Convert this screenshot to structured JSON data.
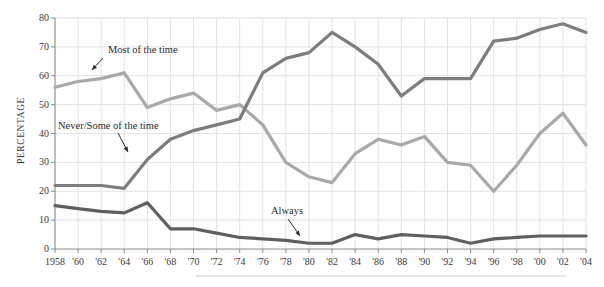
{
  "chart_data": {
    "type": "line",
    "title": "",
    "subtitle": "",
    "xlabel": "",
    "ylabel": "PERCENTAGE",
    "xlim": [
      1958,
      2004
    ],
    "ylim": [
      0,
      80
    ],
    "grid": true,
    "legend_position": "inline-annotations",
    "x": [
      1958,
      1960,
      1962,
      1964,
      1966,
      1968,
      1970,
      1972,
      1974,
      1976,
      1978,
      1980,
      1982,
      1984,
      1986,
      1988,
      1990,
      1992,
      1994,
      1996,
      1998,
      2000,
      2002,
      2004
    ],
    "xtick_labels": [
      "1958",
      "'60",
      "'62",
      "'64",
      "'66",
      "'68",
      "'70",
      "'72",
      "'74",
      "'76",
      "'78",
      "'80",
      "'82",
      "'84",
      "'86",
      "'88",
      "'90",
      "'92",
      "'94",
      "'96",
      "'98",
      "'00",
      "'02",
      "'04"
    ],
    "ytick_labels": [
      "0",
      "10",
      "20",
      "30",
      "40",
      "50",
      "60",
      "70",
      "80"
    ],
    "yticks": [
      0,
      10,
      20,
      30,
      40,
      50,
      60,
      70,
      80
    ],
    "series": [
      {
        "name": "Most of the time",
        "color": "#a9a9a9",
        "values": [
          56,
          58,
          59,
          61,
          49,
          54,
          52,
          48,
          50,
          38,
          33,
          30,
          24,
          23,
          31,
          37,
          35,
          40,
          40,
          36,
          30,
          21,
          26,
          36
        ]
      },
      {
        "name": "Never/Some of the time",
        "color": "#7d7d7d",
        "values": [
          22,
          22,
          22,
          21,
          31,
          37,
          41,
          45,
          50,
          61,
          62,
          63,
          75,
          72,
          67,
          53,
          59,
          59,
          59,
          72,
          73,
          74,
          78,
          75
        ]
      },
      {
        "name": "Always",
        "color": "#5f5f5f",
        "values": [
          15,
          14,
          13,
          12.5,
          16,
          7,
          7,
          5.5,
          4,
          3.5,
          3,
          3,
          3,
          2.5,
          2,
          1.5,
          2,
          3,
          5,
          4,
          5,
          4.5,
          5,
          5
        ]
      }
    ],
    "series_display": [
      {
        "name": "Most of the time",
        "color": "#a9a9a9",
        "points": [
          [
            1958,
            56
          ],
          [
            1960,
            58
          ],
          [
            1962,
            59
          ],
          [
            1964,
            61
          ],
          [
            1966,
            49
          ],
          [
            1968,
            52
          ],
          [
            1970,
            54
          ],
          [
            1972,
            48
          ],
          [
            1974,
            50
          ],
          [
            1976,
            43
          ],
          [
            1978,
            30
          ],
          [
            1980,
            25
          ],
          [
            1982,
            23
          ],
          [
            1984,
            33
          ],
          [
            1986,
            38
          ],
          [
            1988,
            36
          ],
          [
            1990,
            39
          ],
          [
            1992,
            30
          ],
          [
            1994,
            29
          ],
          [
            1996,
            20
          ],
          [
            1998,
            29
          ],
          [
            2000,
            40
          ],
          [
            2002,
            47
          ],
          [
            2004,
            36
          ]
        ]
      },
      {
        "name": "Never/Some of the time",
        "color": "#7d7d7d",
        "points": [
          [
            1958,
            22
          ],
          [
            1960,
            22
          ],
          [
            1962,
            22
          ],
          [
            1964,
            21
          ],
          [
            1966,
            31
          ],
          [
            1968,
            38
          ],
          [
            1970,
            41
          ],
          [
            1972,
            43
          ],
          [
            1974,
            45
          ],
          [
            1976,
            61
          ],
          [
            1978,
            66
          ],
          [
            1980,
            68
          ],
          [
            1982,
            75
          ],
          [
            1984,
            70
          ],
          [
            1986,
            64
          ],
          [
            1988,
            53
          ],
          [
            1990,
            59
          ],
          [
            1992,
            59
          ],
          [
            1994,
            59
          ],
          [
            1996,
            72
          ],
          [
            1998,
            73
          ],
          [
            2000,
            76
          ],
          [
            2002,
            78
          ],
          [
            2004,
            75
          ]
        ]
      },
      {
        "name": "Always",
        "color": "#5f5f5f",
        "points": [
          [
            1958,
            15
          ],
          [
            1960,
            14
          ],
          [
            1962,
            13
          ],
          [
            1964,
            12.5
          ],
          [
            1966,
            16
          ],
          [
            1968,
            7
          ],
          [
            1970,
            7
          ],
          [
            1972,
            5.5
          ],
          [
            1974,
            4
          ],
          [
            1976,
            3.5
          ],
          [
            1978,
            3
          ],
          [
            1980,
            2
          ],
          [
            1982,
            2
          ],
          [
            1984,
            5
          ],
          [
            1986,
            3.5
          ],
          [
            1988,
            5
          ],
          [
            1990,
            4.5
          ],
          [
            1992,
            4
          ],
          [
            1994,
            2
          ],
          [
            1996,
            3.5
          ],
          [
            1998,
            4
          ],
          [
            2000,
            4.5
          ],
          [
            2002,
            4.5
          ],
          [
            2004,
            4.5
          ]
        ]
      }
    ],
    "annotations": [
      {
        "label": "Most of the time",
        "text_x": 108,
        "text_y": 44,
        "arrow": [
          [
            103,
            58
          ],
          [
            92,
            70
          ]
        ]
      },
      {
        "label": "Never/Some of the time",
        "text_x": 58,
        "text_y": 120,
        "arrow": [
          [
            118,
            133
          ],
          [
            128,
            152
          ]
        ]
      },
      {
        "label": "Always",
        "text_x": 271,
        "text_y": 205,
        "arrow": [
          [
            288,
            219
          ],
          [
            300,
            236
          ]
        ]
      }
    ]
  },
  "axis": {
    "y_title": "PERCENTAGE"
  }
}
